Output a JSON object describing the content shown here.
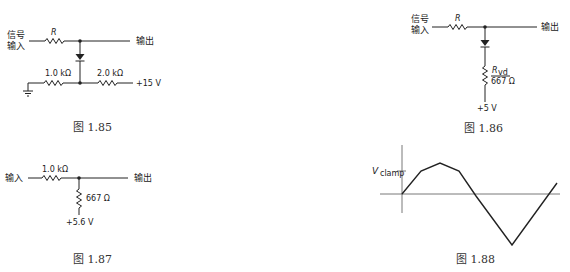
{
  "figures": {
    "fig185": {
      "caption": "图 1.85",
      "input_label_line1": "信号",
      "input_label_line2": "输入",
      "series_resistor": "R",
      "output_label": "输出",
      "bottom_left_resistor": "1.0 kΩ",
      "bottom_right_resistor": "2.0 kΩ",
      "supply": "+15 V"
    },
    "fig186": {
      "caption": "图 1.86",
      "input_label_line1": "信号",
      "input_label_line2": "输入",
      "series_resistor": "R",
      "output_label": "输出",
      "thevenin_resistor_symbol": "R",
      "thevenin_resistor_subscript": "vd",
      "thevenin_resistor_value": "667 Ω",
      "supply": "+5 V"
    },
    "fig187": {
      "caption": "图 1.87",
      "input_label": "输入",
      "series_resistor": "1.0 kΩ",
      "output_label": "输出",
      "shunt_resistor": "667 Ω",
      "supply": "+5.6 V"
    },
    "fig188": {
      "caption": "图 1.88",
      "y_label_main": "V",
      "y_label_sub": "clamp",
      "waveform_points": [
        [
          402,
          194
        ],
        [
          421,
          171
        ],
        [
          440,
          163
        ],
        [
          459,
          171
        ],
        [
          476,
          196
        ],
        [
          512,
          245
        ],
        [
          557,
          183
        ]
      ]
    }
  }
}
